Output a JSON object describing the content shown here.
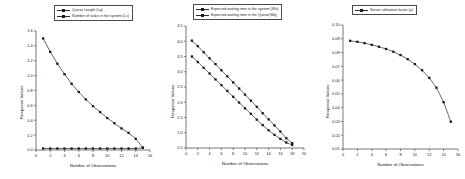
{
  "figure": {
    "background": "#ffffff",
    "line_color": "#2b2b2b",
    "marker_color": "#1a1a1a",
    "axis_color": "#3c3c3c"
  },
  "chart_data": [
    {
      "type": "line",
      "id": "queue-length-chart",
      "title": "",
      "xlabel": "Number of Observations",
      "ylabel": "Response Values",
      "xlim": [
        0,
        16
      ],
      "ylim": [
        0.0,
        1.6
      ],
      "xticks": [
        "0",
        "2",
        "4",
        "6",
        "8",
        "10",
        "12",
        "14",
        "16"
      ],
      "yticks": [
        "0.0",
        "0.2",
        "0.4",
        "0.6",
        "0.8",
        "1.0",
        "1.2",
        "1.4",
        "1.6"
      ],
      "grid": false,
      "legend_position": "top-center",
      "x": [
        1,
        2,
        3,
        4,
        5,
        6,
        7,
        8,
        9,
        10,
        11,
        12,
        13,
        14,
        15
      ],
      "series": [
        {
          "name": "Queue  Length (Lq)",
          "marker": "square",
          "values": [
            1.5,
            1.32,
            1.16,
            1.02,
            0.89,
            0.78,
            0.68,
            0.59,
            0.51,
            0.43,
            0.36,
            0.29,
            0.23,
            0.15,
            0.03
          ]
        },
        {
          "name": "Number of tasks in the system (Ls)",
          "marker": "square",
          "values": [
            0.02,
            0.02,
            0.02,
            0.02,
            0.02,
            0.02,
            0.02,
            0.02,
            0.02,
            0.02,
            0.02,
            0.02,
            0.02,
            0.02,
            0.03
          ]
        }
      ]
    },
    {
      "type": "line",
      "id": "waiting-time-chart",
      "title": "",
      "xlabel": "Number of Observations",
      "ylabel": "Response Values",
      "xlim": [
        0,
        20
      ],
      "ylim": [
        0.5,
        4.5
      ],
      "xticks": [
        "0",
        "2",
        "4",
        "6",
        "8",
        "10",
        "12",
        "14",
        "16",
        "18",
        "20"
      ],
      "yticks": [
        "0.5",
        "1.0",
        "1.5",
        "2.0",
        "2.5",
        "3.0",
        "3.5",
        "4.0",
        "4.5"
      ],
      "grid": false,
      "legend_position": "top-center",
      "x": [
        1,
        2,
        3,
        4,
        5,
        6,
        7,
        8,
        9,
        10,
        11,
        12,
        13,
        14,
        15,
        16,
        17,
        18
      ],
      "series": [
        {
          "name": "Expected waiting time in the system (Ws)",
          "marker": "square",
          "values": [
            4.02,
            3.84,
            3.64,
            3.44,
            3.25,
            3.05,
            2.85,
            2.65,
            2.45,
            2.25,
            2.05,
            1.85,
            1.64,
            1.44,
            1.24,
            1.04,
            0.82,
            0.66
          ]
        },
        {
          "name": "Expected waiting time in the Queue(Wq)",
          "marker": "square",
          "values": [
            3.5,
            3.32,
            3.13,
            2.94,
            2.75,
            2.56,
            2.37,
            2.18,
            1.99,
            1.8,
            1.62,
            1.43,
            1.25,
            1.08,
            0.93,
            0.8,
            0.68,
            0.6
          ]
        }
      ]
    },
    {
      "type": "line",
      "id": "server-utilization-chart",
      "title": "",
      "xlabel": "Number of Observations",
      "ylabel": "Response Values",
      "xlim": [
        0,
        16
      ],
      "ylim": [
        0.01,
        0.1
      ],
      "xticks": [
        "0",
        "2",
        "4",
        "6",
        "8",
        "10",
        "12",
        "14",
        "16"
      ],
      "yticks": [
        "0.01",
        "0.02",
        "0.03",
        "0.04",
        "0.05",
        "0.06",
        "0.07",
        "0.08",
        "0.09",
        "0.10"
      ],
      "grid": false,
      "legend_position": "top-center",
      "x": [
        1,
        2,
        3,
        4,
        5,
        6,
        7,
        8,
        9,
        10,
        11,
        12,
        13,
        14,
        15
      ],
      "series": [
        {
          "name": "Server utilization factor (ρ)",
          "marker": "square",
          "values": [
            0.0885,
            0.0878,
            0.0868,
            0.0856,
            0.0842,
            0.0826,
            0.0806,
            0.0782,
            0.0752,
            0.0716,
            0.0672,
            0.0616,
            0.0545,
            0.044,
            0.0298
          ]
        }
      ]
    }
  ]
}
